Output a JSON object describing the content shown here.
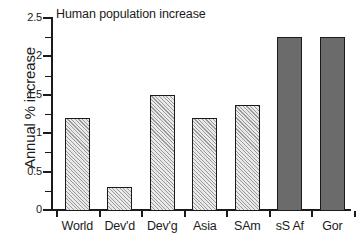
{
  "chart_data": {
    "type": "bar",
    "title": "Human population increase",
    "xlabel": "",
    "ylabel": "Annual % increase",
    "categories": [
      "World",
      "Dev'd",
      "Dev'g",
      "Asia",
      "SAm",
      "sS Af",
      "Gor"
    ],
    "values": [
      1.2,
      0.3,
      1.5,
      1.2,
      1.37,
      2.25,
      2.25
    ],
    "series": [
      {
        "name": "Annual % increase",
        "values": [
          1.2,
          0.3,
          1.5,
          1.2,
          1.37,
          2.25,
          2.25
        ]
      }
    ],
    "ylim": [
      0,
      2.5
    ],
    "ytick_values": [
      0,
      0.5,
      1,
      1.5,
      2,
      2.5
    ],
    "ytick_labels": [
      "0",
      "0.5",
      "1",
      "1.5",
      "2",
      "2.5"
    ],
    "yminor_tick_values": [
      0.25,
      0.75,
      1.25,
      1.75,
      2.25
    ],
    "grid": false,
    "legend": "none",
    "bar_styles": [
      "hatched",
      "hatched",
      "hatched",
      "hatched",
      "hatched",
      "solid",
      "solid"
    ],
    "colors": {
      "hatched_fill": "#e9e9e9",
      "hatch_line": "#9a9a9a",
      "solid_fill": "#6b6b6b",
      "outline": "#1b1b1b",
      "background": "#ffffff",
      "text": "#1a1a1a"
    }
  }
}
